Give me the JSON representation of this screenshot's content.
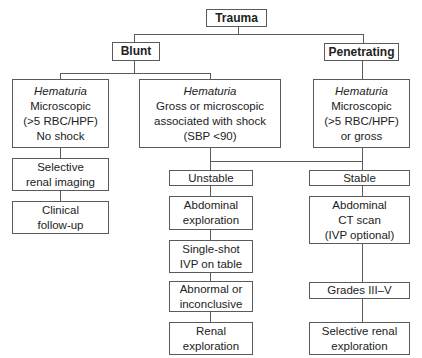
{
  "diagram": {
    "type": "flowchart",
    "root": {
      "label": "Trauma"
    },
    "branches": {
      "blunt": {
        "label": "Blunt"
      },
      "penetrating": {
        "label": "Penetrating"
      }
    },
    "nodes": {
      "blunt_micro": {
        "title": "Hematuria",
        "lines": [
          "Microscopic",
          "(>5 RBC/HPF)",
          "No shock"
        ]
      },
      "blunt_shock": {
        "title": "Hematuria",
        "lines": [
          "Gross or microscopic",
          "associated with shock",
          "(SBP <90)"
        ]
      },
      "pen_hematuria": {
        "title": "Hematuria",
        "lines": [
          "Microscopic",
          "(>5 RBC/HPF)",
          "or gross"
        ]
      },
      "selective_imaging": {
        "lines": [
          "Selective",
          "renal imaging"
        ]
      },
      "clinical_followup": {
        "lines": [
          "Clinical",
          "follow-up"
        ]
      },
      "unstable": {
        "lines": [
          "Unstable"
        ]
      },
      "stable": {
        "lines": [
          "Stable"
        ]
      },
      "abd_exploration": {
        "lines": [
          "Abdominal",
          "exploration"
        ]
      },
      "single_shot": {
        "lines": [
          "Single-shot",
          "IVP on table"
        ]
      },
      "abnormal": {
        "lines": [
          "Abnormal or",
          "inconclusive"
        ]
      },
      "renal_exploration": {
        "lines": [
          "Renal",
          "exploration"
        ]
      },
      "abd_ct": {
        "lines": [
          "Abdominal",
          "CT scan",
          "(IVP optional)"
        ]
      },
      "grades": {
        "lines": [
          "Grades III–V"
        ]
      },
      "selective_renal_exploration": {
        "lines": [
          "Selective renal",
          "exploration"
        ]
      }
    },
    "colors": {
      "border": "#5a5a5a",
      "text": "#222222",
      "background": "#ffffff"
    }
  }
}
